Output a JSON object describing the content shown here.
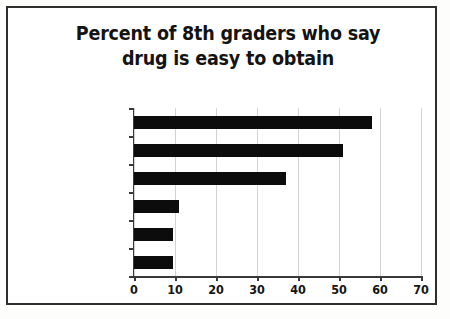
{
  "chart_data": {
    "type": "bar",
    "orientation": "horizontal",
    "title": "Percent of 8th graders who say drug is easy to obtain",
    "title_line_1": "Percent of 8th graders who say",
    "title_line_2": "drug is easy to obtain",
    "xlabel": "",
    "ylabel": "",
    "categories": [
      "Alcohol",
      "Tobacco",
      "Marijuana",
      "Pain medicine",
      "Heroin",
      "Crystal meth"
    ],
    "values": [
      58,
      51,
      37,
      11,
      9.5,
      9.5
    ],
    "xlim": [
      0,
      70
    ],
    "xticks": [
      0,
      10,
      20,
      30,
      40,
      50,
      60,
      70
    ],
    "xtick_labels": [
      "0",
      "10",
      "20",
      "30",
      "40",
      "50",
      "60",
      "70"
    ],
    "grid": "vertical",
    "legend": "none",
    "bar_color": "#0c0c0c"
  },
  "colors": {
    "bar": "#0c0c0c",
    "gridline": "#d2d2d2",
    "axis": "#3a3a3a",
    "border": "#2e2e2e",
    "text": "#141414",
    "background": "#ffffff"
  }
}
